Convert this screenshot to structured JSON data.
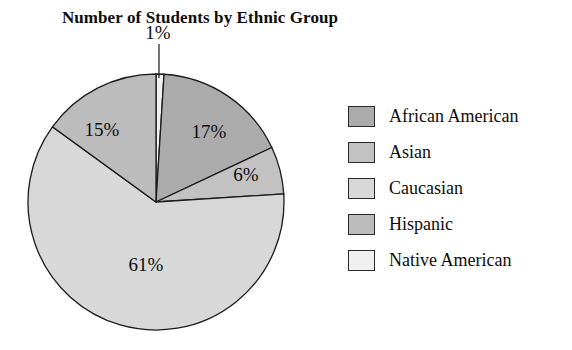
{
  "chart_data": {
    "type": "pie",
    "title": "Number of Students by Ethnic Group",
    "xlabel": "",
    "ylabel": "",
    "legend_position": "right",
    "grid": false,
    "categories": [
      "African American",
      "Asian",
      "Caucasian",
      "Hispanic",
      "Native American"
    ],
    "values": [
      17,
      6,
      61,
      15,
      1
    ],
    "value_labels": [
      "17%",
      "6%",
      "61%",
      "15%",
      "1%"
    ],
    "colors": [
      "#ababab",
      "#c2c2c2",
      "#d8d8d8",
      "#bcbcbc",
      "#f0f0f0"
    ],
    "slice_order_clockwise_from_top": [
      "Native American",
      "African American",
      "Asian",
      "Caucasian",
      "Hispanic"
    ],
    "start_angle_deg": 0,
    "stroke_color": "#1a1a1a"
  },
  "legend": {
    "items": [
      {
        "label": "African American",
        "color": "#ababab"
      },
      {
        "label": "Asian",
        "color": "#c2c2c2"
      },
      {
        "label": "Caucasian",
        "color": "#d8d8d8"
      },
      {
        "label": "Hispanic",
        "color": "#bcbcbc"
      },
      {
        "label": "Native American",
        "color": "#f0f0f0"
      }
    ]
  },
  "slice_labels": {
    "african_american": "17%",
    "asian": "6%",
    "caucasian": "61%",
    "hispanic": "15%",
    "native_american": "1%"
  }
}
